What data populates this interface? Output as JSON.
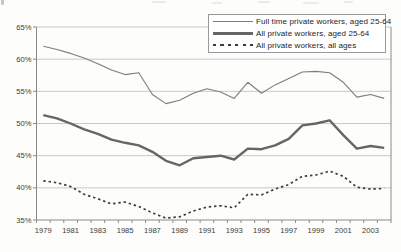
{
  "chart_data": {
    "type": "line",
    "title": "",
    "xlabel": "",
    "ylabel": "",
    "ylim": [
      35,
      65
    ],
    "grid": "horizontal",
    "legend_position": "top-right",
    "x": [
      1979,
      1980,
      1981,
      1982,
      1983,
      1984,
      1985,
      1986,
      1987,
      1988,
      1989,
      1990,
      1991,
      1992,
      1993,
      1994,
      1995,
      1996,
      1997,
      1998,
      1999,
      2000,
      2001,
      2002,
      2003,
      2004
    ],
    "x_tick_labels": [
      "1979",
      "1981",
      "1983",
      "1985",
      "1987",
      "1989",
      "1991",
      "1993",
      "1995",
      "1997",
      "1999",
      "2001",
      "2003"
    ],
    "y_tick_labels": [
      "65%",
      "60%",
      "55%",
      "50%",
      "45%",
      "40%",
      "35%"
    ],
    "series": [
      {
        "name": "Full time private workers, aged 25-64",
        "line_style": "thin-solid",
        "color": "#7d7d7d",
        "width": 1.1,
        "dash": "",
        "values": [
          62.0,
          61.5,
          60.9,
          60.2,
          59.3,
          58.3,
          57.6,
          57.9,
          54.5,
          53.1,
          53.6,
          54.7,
          55.4,
          54.9,
          53.9,
          56.4,
          54.7,
          56.0,
          57.0,
          58.0,
          58.1,
          57.9,
          56.4,
          54.1,
          54.5,
          53.9
        ]
      },
      {
        "name": "All private workers, aged 25-64",
        "line_style": "thick-solid",
        "color": "#666666",
        "width": 2.4,
        "dash": "",
        "values": [
          51.3,
          50.8,
          50.0,
          49.1,
          48.4,
          47.5,
          47.0,
          46.6,
          45.6,
          44.2,
          43.5,
          44.6,
          44.8,
          45.0,
          44.4,
          46.1,
          46.0,
          46.6,
          47.6,
          49.7,
          50.0,
          50.5,
          48.2,
          46.1,
          46.5,
          46.2
        ]
      },
      {
        "name": "All private workers, all ages",
        "line_style": "dotted",
        "color": "#3c3c3c",
        "width": 1.7,
        "dash": "2.4 2.9",
        "values": [
          41.1,
          40.8,
          40.2,
          39.0,
          38.3,
          37.5,
          37.8,
          37.1,
          36.1,
          35.3,
          35.5,
          36.4,
          37.0,
          37.2,
          36.9,
          39.0,
          38.9,
          39.8,
          40.5,
          41.8,
          42.0,
          42.6,
          41.8,
          40.1,
          39.8,
          39.9
        ]
      }
    ],
    "colors": {
      "gridline": "#c9c9c9",
      "axis": "#8a8a8a",
      "tick_text": "#3a3a3a",
      "legend_border": "#9a9a9a",
      "background": "#fdfdfc"
    }
  }
}
